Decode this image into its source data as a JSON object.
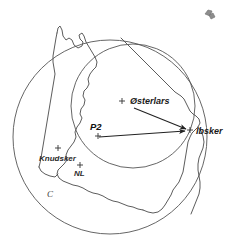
{
  "figure": {
    "background_color": "#ffffff"
  },
  "places": [
    {
      "id": "osterlars",
      "label": "Østerlars",
      "x": 130,
      "y": 104,
      "marker_x": 122,
      "marker_y": 101
    },
    {
      "id": "ibsker",
      "label": "Ibsker",
      "x": 196,
      "y": 134,
      "marker_x": 190,
      "marker_y": 130
    },
    {
      "id": "knudsker",
      "label": "Knudsker",
      "x": 39,
      "y": 161,
      "marker_x": 58,
      "marker_y": 148
    },
    {
      "id": "nl",
      "label": "NL",
      "x": 74,
      "y": 176,
      "marker_x": 80,
      "marker_y": 165
    },
    {
      "id": "p2",
      "label": "P2",
      "x": 90,
      "y": 130,
      "marker_x": 98,
      "marker_y": 136
    }
  ],
  "circles": [
    {
      "id": "outer-circle",
      "label": "C",
      "cx": 110,
      "cy": 137,
      "r": 97,
      "label_x": 47,
      "label_y": 197
    },
    {
      "id": "inner-circle",
      "label": "",
      "cx": 133,
      "cy": 106,
      "r": 62,
      "label_x": 0,
      "label_y": 0
    }
  ],
  "arrows": [
    {
      "id": "arrow-osterlars-ibsker",
      "from": "Østerlars",
      "to": "Ibsker",
      "x1": 134,
      "y1": 108,
      "x2": 189,
      "y2": 130
    },
    {
      "id": "arrow-p2-ibsker",
      "from": "P2",
      "to": "Ibsker",
      "x1": 99,
      "y1": 137,
      "x2": 188,
      "y2": 131
    }
  ],
  "corner_glyph": {
    "name": "artifact-glyph",
    "x": 205,
    "y": 10
  },
  "colors": {
    "coastline": "#4a4a4a",
    "circle": "#555555",
    "arrow": "#222222",
    "label": "#111111",
    "circle_label": "#3a3a3a"
  }
}
